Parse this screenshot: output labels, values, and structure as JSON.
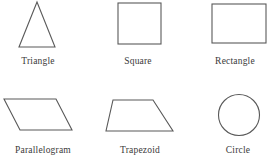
{
  "page": {
    "background_color": "#ffffff",
    "stroke_color": "#595959",
    "text_color": "#3a3a3a",
    "width": 268,
    "height": 167
  },
  "diagram": {
    "type": "geometric-shapes-chart",
    "rows": 2,
    "columns": 3,
    "shapes": [
      {
        "id": "triangle",
        "label": "Triangle",
        "kind": "polygon",
        "points": "23,47 5,47",
        "vertices": "23,2 5,47 41,47"
      },
      {
        "id": "square",
        "label": "Square",
        "kind": "rect",
        "x": 4,
        "y": 3,
        "width": 43,
        "height": 41
      },
      {
        "id": "rectangle",
        "label": "Rectangle",
        "kind": "rect",
        "x": 6,
        "y": 4,
        "width": 54,
        "height": 39
      },
      {
        "id": "parallelogram",
        "label": "Parallelogram",
        "kind": "polygon",
        "vertices": "4,6 56,6 72,37 20,37"
      },
      {
        "id": "trapezoid",
        "label": "Trapezoid",
        "kind": "polygon",
        "vertices": "13,7 53,7 73,38 6,38"
      },
      {
        "id": "circle",
        "label": "Circle",
        "kind": "circle",
        "cx": 25,
        "cy": 24,
        "r": 20.5
      }
    ]
  }
}
